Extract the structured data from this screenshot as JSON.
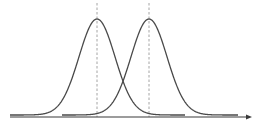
{
  "diagram": {
    "type": "two overlapping bell curves",
    "colors": {
      "curve": "#4a4a4a",
      "axis": "#3a3a3a",
      "dashed_line": "#9a9a9a",
      "background": "#ffffff"
    },
    "axis": {
      "y": 117,
      "x_start": 10,
      "x_end": 252,
      "arrow": "right"
    },
    "curves": [
      {
        "name": "left-distribution",
        "center_x": 97,
        "peak_y": 19,
        "baseline_y": 115,
        "sigma": 18,
        "x_start": 10,
        "x_end": 185
      },
      {
        "name": "right-distribution",
        "center_x": 149,
        "peak_y": 19,
        "baseline_y": 115,
        "sigma": 18,
        "x_start": 62,
        "x_end": 238
      }
    ],
    "dashed_lines": [
      {
        "name": "left-mean-line",
        "x": 97,
        "y_top": 3,
        "y_bottom": 117
      },
      {
        "name": "right-mean-line",
        "x": 149,
        "y_top": 3,
        "y_bottom": 117
      }
    ]
  }
}
